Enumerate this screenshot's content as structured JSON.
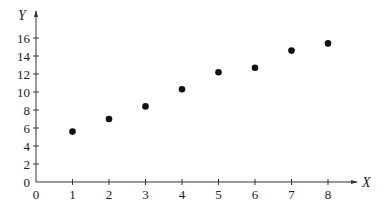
{
  "chart_data": {
    "type": "scatter",
    "title": "",
    "xlabel": "X",
    "ylabel": "Y",
    "x": [
      1,
      2,
      3,
      4,
      5,
      6,
      7,
      8
    ],
    "series": [
      {
        "name": "data",
        "values": [
          5.6,
          7.0,
          8.4,
          10.3,
          12.2,
          12.7,
          14.6,
          15.4
        ]
      }
    ],
    "xlim": [
      0,
      8.5
    ],
    "ylim": [
      0,
      17.5
    ],
    "xticks": [
      0,
      1,
      2,
      3,
      4,
      5,
      6,
      7,
      8
    ],
    "yticks": [
      0,
      2,
      4,
      6,
      8,
      10,
      12,
      14,
      16
    ],
    "xtick_labels": [
      "0",
      "1",
      "2",
      "3",
      "4",
      "5",
      "6",
      "7",
      "8"
    ],
    "ytick_labels": [
      "0",
      "2",
      "4",
      "6",
      "8",
      "10",
      "12",
      "14",
      "16"
    ],
    "grid": false,
    "legend": null,
    "marker_color": "#111111",
    "axis_color": "#333333"
  }
}
